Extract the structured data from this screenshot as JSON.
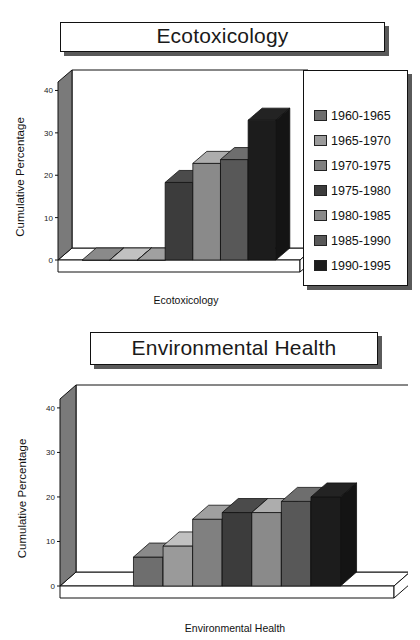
{
  "charts": [
    {
      "title": "Ecotoxicology",
      "ylabel": "Cumulative Percentage",
      "xlabel": "Ecotoxicology",
      "yticks": [
        "0",
        "10",
        "20",
        "30",
        "40"
      ]
    },
    {
      "title": "Environmental Health",
      "ylabel": "Cumulative Percentage",
      "xlabel": "Environmental Health",
      "yticks": [
        "0",
        "10",
        "20",
        "30",
        "40"
      ]
    }
  ],
  "legend": {
    "items": [
      {
        "label": "1960-1965",
        "color": "#6e6e6e"
      },
      {
        "label": "1965-1970",
        "color": "#9a9a9a"
      },
      {
        "label": "1970-1975",
        "color": "#808080"
      },
      {
        "label": "1975-1980",
        "color": "#3c3c3c"
      },
      {
        "label": "1980-1985",
        "color": "#8a8a8a"
      },
      {
        "label": "1985-1990",
        "color": "#585858"
      },
      {
        "label": "1990-1995",
        "color": "#1c1c1c"
      }
    ]
  },
  "chart_data": [
    {
      "type": "bar",
      "title": "Ecotoxicology",
      "xlabel": "Ecotoxicology",
      "ylabel": "Cumulative Percentage",
      "categories": [
        "1960-1965",
        "1965-1970",
        "1970-1975",
        "1975-1980",
        "1980-1985",
        "1985-1990",
        "1990-1995"
      ],
      "values": [
        0,
        0,
        0,
        18.3,
        22.8,
        23.7,
        33.0
      ],
      "ylim": [
        0,
        42
      ],
      "yticks": [
        0,
        10,
        20,
        30,
        40
      ],
      "grid": false,
      "legend_position": "right",
      "projection": "3d"
    },
    {
      "type": "bar",
      "title": "Environmental Health",
      "xlabel": "Environmental Health",
      "ylabel": "Cumulative Percentage",
      "categories": [
        "1960-1965",
        "1965-1970",
        "1970-1975",
        "1975-1980",
        "1980-1985",
        "1985-1990",
        "1990-1995"
      ],
      "values": [
        6.5,
        9.0,
        15.0,
        16.5,
        16.5,
        19.0,
        20.0
      ],
      "ylim": [
        0,
        42
      ],
      "yticks": [
        0,
        10,
        20,
        30,
        40
      ],
      "grid": false,
      "legend_position": "none",
      "projection": "3d"
    }
  ]
}
